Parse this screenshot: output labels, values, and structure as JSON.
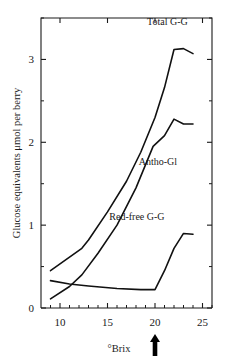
{
  "chart_data": {
    "type": "line",
    "title": "",
    "subtitle": "",
    "xlabel": "°Brix",
    "ylabel": "Glucose equivalents μmol per berry",
    "xlim": [
      8,
      26
    ],
    "ylim": [
      0,
      3.5
    ],
    "grid": false,
    "legend_position": "inline-labels",
    "x_ticks_major": [
      10,
      15,
      20,
      25
    ],
    "x_ticks_major_labels": [
      "10",
      "15",
      "20",
      "25"
    ],
    "x_ticks_minor": [
      9,
      11,
      12,
      13,
      14,
      16,
      17,
      18,
      19,
      21,
      22,
      23,
      24,
      26
    ],
    "y_ticks_major": [
      0,
      1,
      2,
      3
    ],
    "y_ticks_major_labels": [
      "0",
      "1",
      "2",
      "3"
    ],
    "y_ticks_minor": [
      0.5,
      1.5,
      2.5,
      3.5
    ],
    "series": [
      {
        "name": "Total G-G",
        "label": "Total G-G",
        "label_x": 21.3,
        "label_y": 3.42,
        "x": [
          9.0,
          12.3,
          13.0,
          15.0,
          17.0,
          18.5,
          20.0,
          21.0,
          22.0,
          23.0,
          24.0
        ],
        "values": [
          0.45,
          0.72,
          0.82,
          1.16,
          1.53,
          1.88,
          2.3,
          2.66,
          3.12,
          3.13,
          3.07
        ]
      },
      {
        "name": "Antho-Gl",
        "label": "Antho-Gl",
        "label_x": 20.3,
        "label_y": 1.72,
        "x": [
          9.0,
          11.0,
          12.3,
          14.0,
          16.0,
          18.0,
          19.8,
          21.0,
          22.0,
          23.0,
          24.0
        ],
        "values": [
          0.11,
          0.26,
          0.4,
          0.66,
          1.0,
          1.45,
          1.95,
          2.08,
          2.28,
          2.22,
          2.22
        ]
      },
      {
        "name": "Red-free G-G",
        "label": "Red-free G-G",
        "label_x": 18.1,
        "label_y": 1.06,
        "x": [
          9.0,
          11.0,
          13.0,
          16.0,
          18.5,
          20.0,
          21.0,
          22.0,
          23.0,
          24.0
        ],
        "values": [
          0.33,
          0.29,
          0.265,
          0.235,
          0.222,
          0.222,
          0.45,
          0.72,
          0.9,
          0.89
        ]
      }
    ],
    "annotations": [
      {
        "name": "brix-marker-arrow",
        "type": "arrow-up",
        "x": 20.0,
        "description": "bold upward arrow below axis"
      }
    ]
  }
}
